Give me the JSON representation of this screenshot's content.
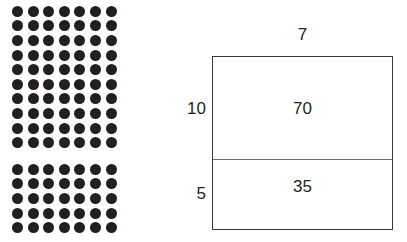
{
  "dot_array": {
    "columns": 7,
    "groups": [
      {
        "name": "top-group",
        "rows": 10,
        "columns": 7,
        "total": 70,
        "dot_color": "#231f20"
      },
      {
        "name": "bottom-group",
        "rows": 5,
        "columns": 7,
        "total": 35,
        "dot_color": "#231f20"
      }
    ]
  },
  "area_model": {
    "width_label": "7",
    "regions": [
      {
        "name": "upper-region",
        "height_label": "10",
        "area_label": "70"
      },
      {
        "name": "lower-region",
        "height_label": "5",
        "area_label": "35"
      }
    ],
    "border_color": "#3a3a3a",
    "divider_color": "#6d6d6d"
  },
  "chart_data": {
    "type": "bar",
    "categories": [
      "70",
      "35"
    ],
    "values": [
      70,
      35
    ],
    "xlabel": "",
    "ylabel": "",
    "ylim": [
      0,
      70
    ]
  }
}
